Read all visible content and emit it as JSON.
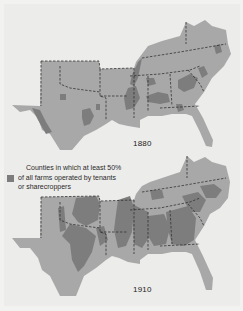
{
  "maps": [
    {
      "year": "1880",
      "region": "Southern United States"
    },
    {
      "year": "1910",
      "region": "Southern United States"
    }
  ],
  "legend": {
    "lines": [
      "Counties in which at least 50%",
      "of all farms operated by tenants",
      "or sharecroppers"
    ],
    "swatch_color": "#7d7d7d"
  },
  "colors": {
    "background": "#ececea",
    "land": "#a8a8a8",
    "tenant_counties": "#7d7d7d",
    "state_borders": "#333333"
  }
}
